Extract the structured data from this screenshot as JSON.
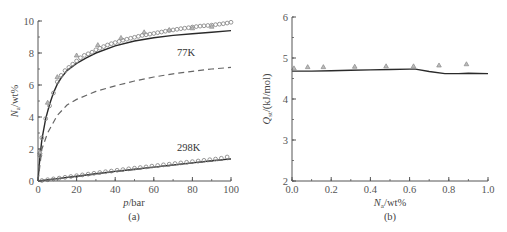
{
  "chart_data": [
    {
      "panel": "(a)",
      "type": "line",
      "title": "",
      "xlabel": "p/bar",
      "ylabel": "N_a/wt%",
      "xlim": [
        0,
        100
      ],
      "ylim": [
        0,
        10
      ],
      "xticks": [
        "0",
        "20",
        "40",
        "60",
        "80",
        "100"
      ],
      "yticks": [
        "0",
        "2",
        "4",
        "6",
        "8",
        "10"
      ],
      "grid": false,
      "legend": null,
      "annotations": [
        "77K",
        "298K"
      ],
      "series": [
        {
          "name": "77K fit (solid)",
          "style": "solid",
          "x": [
            0,
            1,
            2,
            4,
            6,
            8,
            10,
            12,
            15,
            20,
            25,
            30,
            40,
            50,
            60,
            70,
            80,
            90,
            100
          ],
          "y": [
            0,
            1.5,
            2.6,
            3.9,
            4.8,
            5.5,
            6.05,
            6.45,
            6.9,
            7.35,
            7.7,
            8.0,
            8.45,
            8.75,
            8.95,
            9.1,
            9.2,
            9.3,
            9.4
          ]
        },
        {
          "name": "77K experimental (circles)",
          "style": "circle",
          "x": [
            1,
            2,
            4,
            6,
            8,
            10,
            12,
            14,
            16,
            18,
            20,
            22,
            24,
            26,
            28,
            30,
            32,
            34,
            36,
            38,
            40,
            42,
            44,
            46,
            48,
            50,
            52,
            54,
            56,
            58,
            60,
            62,
            64,
            66,
            68,
            70,
            72,
            74,
            76,
            78,
            80,
            82,
            84,
            86,
            88,
            90,
            92,
            94,
            96,
            98,
            100
          ],
          "y": [
            1.6,
            2.7,
            3.9,
            4.7,
            5.5,
            6.2,
            6.6,
            6.9,
            7.1,
            7.3,
            7.5,
            7.7,
            7.85,
            7.95,
            8.05,
            8.2,
            8.3,
            8.4,
            8.5,
            8.58,
            8.65,
            8.72,
            8.8,
            8.86,
            8.92,
            8.98,
            9.04,
            9.1,
            9.14,
            9.18,
            9.22,
            9.27,
            9.31,
            9.36,
            9.4,
            9.44,
            9.48,
            9.52,
            9.55,
            9.58,
            9.62,
            9.65,
            9.68,
            9.7,
            9.72,
            9.74,
            9.77,
            9.8,
            9.83,
            9.87,
            9.92
          ]
        },
        {
          "name": "77K triangles",
          "style": "triangle",
          "x": [
            1,
            5,
            10,
            20,
            31,
            43,
            55,
            68,
            80,
            90
          ],
          "y": [
            1.8,
            4.9,
            6.5,
            7.85,
            8.5,
            8.95,
            9.3,
            9.45,
            9.55,
            9.65
          ]
        },
        {
          "name": "77K dashed",
          "style": "dashed",
          "x": [
            0,
            2,
            5,
            10,
            15,
            20,
            30,
            40,
            50,
            60,
            70,
            80,
            90,
            100
          ],
          "y": [
            0,
            2.0,
            3.0,
            4.1,
            4.75,
            5.1,
            5.6,
            5.95,
            6.25,
            6.5,
            6.7,
            6.85,
            7.0,
            7.1
          ]
        },
        {
          "name": "298K fit (solid)",
          "style": "solid",
          "x": [
            0,
            10,
            20,
            30,
            40,
            50,
            60,
            70,
            80,
            90,
            100
          ],
          "y": [
            0,
            0.15,
            0.3,
            0.45,
            0.6,
            0.74,
            0.87,
            1.0,
            1.13,
            1.26,
            1.38
          ]
        },
        {
          "name": "298K experimental (circles)",
          "style": "circle",
          "x": [
            2,
            5,
            8,
            11,
            14,
            17,
            20,
            23,
            26,
            29,
            32,
            35,
            38,
            41,
            44,
            47,
            50,
            53,
            56,
            59,
            62,
            65,
            68,
            71,
            74,
            77,
            80,
            83,
            86,
            89,
            92,
            95,
            98
          ],
          "y": [
            0.03,
            0.08,
            0.13,
            0.18,
            0.23,
            0.28,
            0.33,
            0.38,
            0.43,
            0.48,
            0.53,
            0.58,
            0.62,
            0.67,
            0.71,
            0.76,
            0.8,
            0.84,
            0.88,
            0.93,
            0.97,
            1.01,
            1.05,
            1.09,
            1.13,
            1.17,
            1.21,
            1.25,
            1.29,
            1.33,
            1.37,
            1.42,
            1.5
          ]
        },
        {
          "name": "298K dashed",
          "style": "dashed",
          "x": [
            0,
            20,
            40,
            60,
            80,
            100
          ],
          "y": [
            0,
            0.28,
            0.58,
            0.86,
            1.12,
            1.36
          ]
        }
      ]
    },
    {
      "panel": "(b)",
      "type": "line",
      "title": "",
      "xlabel": "N_a/wt%",
      "ylabel": "Q_st/(kJ/mol)",
      "xlim": [
        0.0,
        1.0
      ],
      "ylim": [
        2,
        6
      ],
      "xticks": [
        "0.0",
        "0.2",
        "0.4",
        "0.6",
        "0.8",
        "1.0"
      ],
      "yticks": [
        "2",
        "3",
        "4",
        "5",
        "6"
      ],
      "grid": false,
      "legend": null,
      "series": [
        {
          "name": "Q_st line",
          "style": "solid",
          "x": [
            0.0,
            0.1,
            0.2,
            0.3,
            0.4,
            0.5,
            0.6,
            0.63,
            0.7,
            0.78,
            0.85,
            0.9,
            1.0
          ],
          "y": [
            4.68,
            4.68,
            4.69,
            4.7,
            4.71,
            4.72,
            4.73,
            4.73,
            4.67,
            4.62,
            4.62,
            4.63,
            4.62
          ]
        },
        {
          "name": "Q_st triangles",
          "style": "triangle",
          "x": [
            0.01,
            0.08,
            0.16,
            0.32,
            0.48,
            0.62,
            0.75,
            0.89
          ],
          "y": [
            4.75,
            4.78,
            4.78,
            4.79,
            4.8,
            4.8,
            4.82,
            4.85
          ]
        }
      ]
    }
  ],
  "panels": {
    "a": {
      "caption": "(a)",
      "xlabel_main": "p",
      "xlabel_unit": "/bar",
      "ylabel_main": "N",
      "ylabel_sub": "a",
      "ylabel_unit": "/wt%",
      "annot_77": "77K",
      "annot_298": "298K",
      "xticks": [
        "0",
        "20",
        "40",
        "60",
        "80",
        "100"
      ],
      "yticks": [
        "0",
        "2",
        "4",
        "6",
        "8",
        "10"
      ]
    },
    "b": {
      "caption": "(b)",
      "xlabel_main": "N",
      "xlabel_sub": "a",
      "xlabel_unit": "/wt%",
      "ylabel_main": "Q",
      "ylabel_sub": "st",
      "ylabel_unit": "/(kJ/mol)",
      "xticks": [
        "0.0",
        "0.2",
        "0.4",
        "0.6",
        "0.8",
        "1.0"
      ],
      "yticks": [
        "2",
        "3",
        "4",
        "5",
        "6"
      ]
    }
  },
  "colors": {
    "axis": "#555555",
    "line_solid": "#2a2a2a",
    "line_dashed": "#666666",
    "marker": "#8a8a8a"
  }
}
